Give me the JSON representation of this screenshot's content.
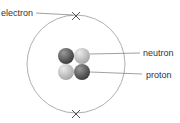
{
  "diagram": {
    "labels": {
      "electron": "electron",
      "neutron": "neutron",
      "proton": "proton"
    },
    "colors": {
      "orbit": "#9a9a9a",
      "line": "#777777",
      "dark_particle": "#5a5a5a",
      "light_particle": "#c4c4c4",
      "cross": "#555555"
    }
  }
}
